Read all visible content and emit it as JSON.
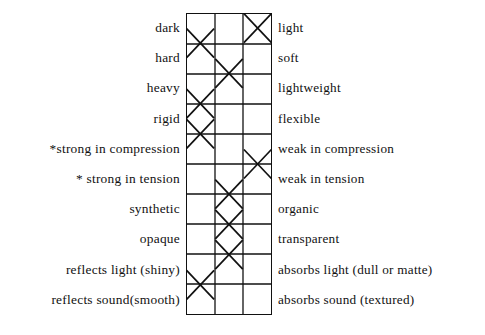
{
  "chart_data": {
    "type": "table",
    "title": "",
    "subtitle": "",
    "xlabel": "",
    "ylabel": "",
    "columns": 3,
    "column_headers": [
      "",
      "",
      ""
    ],
    "grid": true,
    "legend": "none",
    "note": "Bipolar semantic-differential rating grid: each row is an opposing adjective pair with an X placed in one of three columns.",
    "categories": [
      "dark / light",
      "hard / soft",
      "heavy / lightweight",
      "rigid / flexible",
      "strong in compression / weak in compression",
      "strong in tension / weak in tension",
      "synthetic / organic",
      "opaque / transparent",
      "reflects light (shiny) / absorbs light (dull or matte)",
      "reflects sound(smooth) / absorbs sound (textured)"
    ],
    "values": [
      3,
      1,
      2,
      1,
      1,
      3,
      2,
      2,
      2,
      1
    ],
    "ylim": [
      1,
      3
    ],
    "rows": [
      {
        "left": "dark",
        "right": "light",
        "mark_column": 3
      },
      {
        "left": "hard",
        "right": "soft",
        "mark_column": 1
      },
      {
        "left": "heavy",
        "right": "lightweight",
        "mark_column": 2
      },
      {
        "left": "rigid",
        "right": "flexible",
        "mark_column": 1
      },
      {
        "left": "*strong in compression",
        "right": "weak in compression",
        "mark_column": 1
      },
      {
        "left": "* strong in tension",
        "right": "weak in tension",
        "mark_column": 3
      },
      {
        "left": "synthetic",
        "right": "organic",
        "mark_column": 2
      },
      {
        "left": "opaque",
        "right": "transparent",
        "mark_column": 2
      },
      {
        "left": "reflects light (shiny)",
        "right": "absorbs light (dull or matte)",
        "mark_column": 2
      },
      {
        "left": "reflects sound(smooth)",
        "right": "absorbs sound (textured)",
        "mark_column": 1
      }
    ]
  },
  "colors": {
    "ink": "#111111",
    "paper": "#ffffff",
    "grid_line": "#111111",
    "mark": "#111111"
  }
}
